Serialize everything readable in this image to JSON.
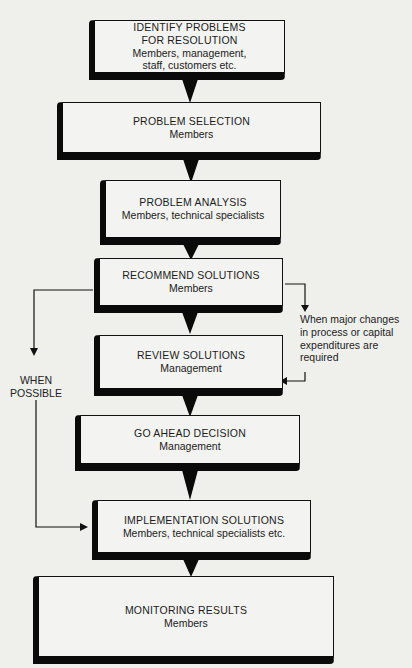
{
  "diagram": {
    "type": "flowchart",
    "steps": [
      {
        "title": "IDENTIFY PROBLEMS",
        "title2": "FOR RESOLUTION",
        "who": "Members, management,",
        "who2": "staff, customers etc."
      },
      {
        "title": "PROBLEM SELECTION",
        "who": "Members"
      },
      {
        "title": "PROBLEM ANALYSIS",
        "who": "Members, technical specialists"
      },
      {
        "title": "RECOMMEND SOLUTIONS",
        "who": "Members"
      },
      {
        "title": "REVIEW SOLUTIONS",
        "who": "Management"
      },
      {
        "title": "GO AHEAD DECISION",
        "who": "Management"
      },
      {
        "title": "IMPLEMENTATION SOLUTIONS",
        "who": "Members, technical specialists etc."
      },
      {
        "title": "MONITORING RESULTS",
        "who": "Members"
      }
    ],
    "notes": {
      "right": [
        "When major changes",
        "in process or capital",
        "expenditures are",
        "required"
      ],
      "left": [
        "WHEN",
        "POSSIBLE"
      ]
    },
    "colors": {
      "background": "#efefec",
      "box_fill": "#f3f3f1",
      "ink": "#0a0a0a"
    }
  }
}
